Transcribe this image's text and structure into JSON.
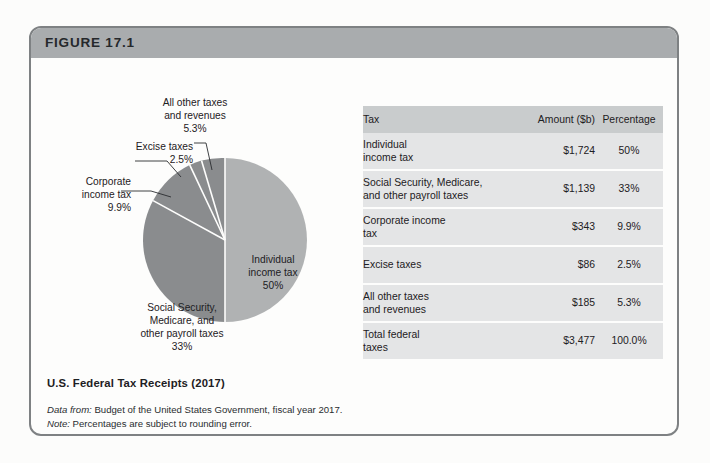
{
  "figure": {
    "number_label": "FIGURE 17.1",
    "caption_title": "U.S. Federal Tax Receipts (2017)",
    "source_prefix": "Data from:",
    "source_text": " Budget of the United States Government, fiscal year 2017.",
    "note_prefix": "Note:",
    "note_text": " Percentages are subject to rounding error."
  },
  "colors": {
    "slice_light": "#b0b2b3",
    "slice_dark": "#8a8c8e",
    "header_band": "#a9acae",
    "table_header": "#c9cccd",
    "table_row": "#e4e5e6",
    "border": "#7e8183",
    "text": "#1d2023"
  },
  "table": {
    "columns": [
      "Tax",
      "Amount ($b)",
      "Percentage"
    ],
    "rows": [
      {
        "tax": "Individual\nincome tax",
        "amount": "$1,724",
        "percentage": "50%"
      },
      {
        "tax": "Social Security, Medicare,\nand other payroll taxes",
        "amount": "$1,139",
        "percentage": "33%"
      },
      {
        "tax": "Corporate income\ntax",
        "amount": "$343",
        "percentage": "9.9%"
      },
      {
        "tax": "Excise taxes",
        "amount": "$86",
        "percentage": "2.5%"
      },
      {
        "tax": "All other taxes\nand revenues",
        "amount": "$185",
        "percentage": "5.3%"
      },
      {
        "tax": "Total federal\ntaxes",
        "amount": "$3,477",
        "percentage": "100.0%"
      }
    ]
  },
  "pie_labels": {
    "individual": "Individual\nincome tax\n50%",
    "social": "Social Security,\nMedicare, and\nother payroll taxes\n33%",
    "all_other": "All other taxes\nand revenues\n5.3%",
    "excise": "Excise taxes\n2.5%",
    "corporate": "Corporate\nincome tax\n9.9%"
  },
  "chart_data": {
    "type": "pie",
    "title": "U.S. Federal Tax Receipts (2017)",
    "unit": "$ billions",
    "categories": [
      "Individual income tax",
      "Social Security, Medicare, and other payroll taxes",
      "Corporate income tax",
      "Excise taxes",
      "All other taxes and revenues"
    ],
    "values": [
      50,
      33,
      9.9,
      2.5,
      5.3
    ],
    "amounts": [
      1724,
      1139,
      343,
      86,
      185
    ],
    "total_amount": 3477,
    "total_percentage": 100.0,
    "slice_colors": [
      "#b0b2b3",
      "#8a8c8e",
      "#8a8c8e",
      "#8a8c8e",
      "#8a8c8e"
    ],
    "start_angle_deg": 0,
    "direction": "clockwise",
    "legend": "none",
    "labels_inside": [
      "Individual income tax 50%",
      "Social Security, Medicare, and other payroll taxes 33%"
    ],
    "labels_outside": [
      "Corporate income tax 9.9%",
      "Excise taxes 2.5%",
      "All other taxes and revenues 5.3%"
    ]
  }
}
